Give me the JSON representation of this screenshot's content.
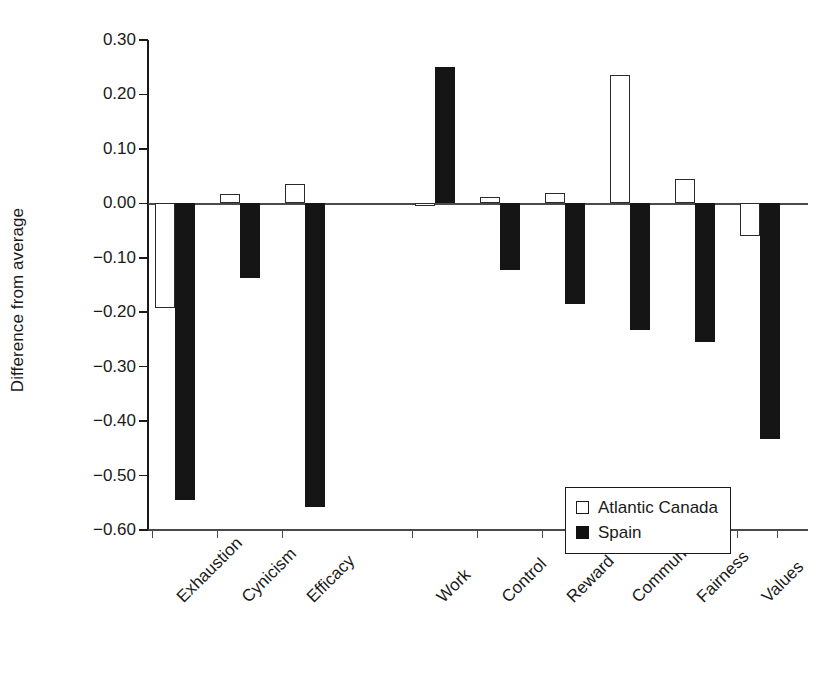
{
  "chart_data": {
    "type": "bar",
    "title": "",
    "xlabel": "",
    "ylabel": "Difference from average",
    "ylim": [
      -0.6,
      0.3
    ],
    "ytick_labels": [
      "0.30",
      "0.20",
      "0.10",
      "0.00",
      "−0.10",
      "−0.20",
      "−0.30",
      "−0.40",
      "−0.50",
      "−0.60"
    ],
    "ytick_values": [
      0.3,
      0.2,
      0.1,
      0.0,
      -0.1,
      -0.2,
      -0.3,
      -0.4,
      -0.5,
      -0.6
    ],
    "grid": false,
    "legend_position": "lower-right inside plot",
    "categories": [
      "Exhaustion",
      "Cynicism",
      "Efficacy",
      "Work",
      "Control",
      "Reward",
      "Community",
      "Fairness",
      "Values"
    ],
    "category_group_gap_after": "Efficacy",
    "series": [
      {
        "name": "Atlantic Canada",
        "color": "#ffffff",
        "edge_color": "#2b2b2b",
        "values": [
          -0.192,
          0.018,
          0.035,
          -0.004,
          0.011,
          0.019,
          0.236,
          0.045,
          -0.06
        ]
      },
      {
        "name": "Spain",
        "color": "#151515",
        "edge_color": "#151515",
        "values": [
          -0.545,
          -0.138,
          -0.558,
          0.25,
          -0.122,
          -0.185,
          -0.233,
          -0.255,
          -0.432
        ]
      }
    ]
  },
  "legend": {
    "items": [
      {
        "label": "Atlantic Canada",
        "style": "light"
      },
      {
        "label": "Spain",
        "style": "dark"
      }
    ]
  }
}
